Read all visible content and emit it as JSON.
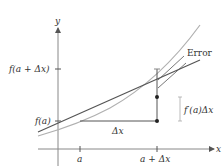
{
  "axes": {
    "x_label": "x",
    "y_label": "y"
  },
  "ticks": {
    "x": [
      {
        "label": "a"
      },
      {
        "label": "a + Δx"
      }
    ],
    "y": [
      {
        "label": "f(a)"
      },
      {
        "label": "f(a + Δx)"
      }
    ]
  },
  "annotations": {
    "error": "Error",
    "rise": "f′(a)Δx",
    "run": "Δx"
  },
  "colors": {
    "axis": "#888888",
    "curve": "#b0b0b0",
    "tangent": "#555555",
    "text": "#333333"
  }
}
